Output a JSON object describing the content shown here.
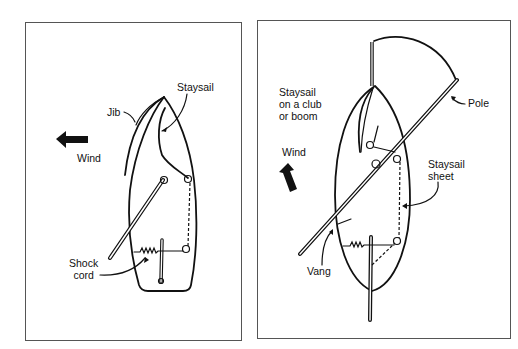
{
  "diagrams": [
    {
      "id": "left",
      "description": "Jib with staysail, wind from starboard side",
      "labels": {
        "jib": "Jib",
        "staysail": "Staysail",
        "wind": "Wind",
        "shock_cord": "Shock\ncord"
      }
    },
    {
      "id": "right",
      "description": "Staysail on a club with spinnaker pole",
      "labels": {
        "staysail_club": "Staysail\non a club\nor boom",
        "wind": "Wind",
        "pole": "Pole",
        "staysail_sheet": "Staysail\nsheet",
        "vang": "Vang"
      }
    }
  ],
  "colors": {
    "ink": "#111111",
    "border": "#555555",
    "background": "#ffffff"
  }
}
